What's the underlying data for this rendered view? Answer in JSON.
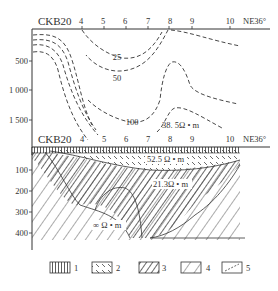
{
  "top_section": {
    "profile_name": "CKB20",
    "direction": "NE36°",
    "station_labels": [
      "4",
      "5",
      "6",
      "7",
      "8",
      "9",
      "10"
    ],
    "depth_ticks": [
      "500",
      "1 000",
      "1 500"
    ],
    "contour_labels": [
      "25",
      "50",
      "100"
    ],
    "resistivity_label": "38. 5Ω • m"
  },
  "bottom_section": {
    "profile_name": "CKB20",
    "direction": "NE36°",
    "station_labels": [
      "4",
      "5",
      "6",
      "7",
      "8",
      "9",
      "10"
    ],
    "depth_ticks": [
      "100",
      "200",
      "300",
      "400"
    ],
    "layer_labels": {
      "surface": "52.5 Ω • m",
      "middle": "21.3Ω • m",
      "basement": "∞ Ω • m"
    }
  },
  "legend": {
    "items": [
      {
        "label": "1",
        "pattern": "vertical-lines"
      },
      {
        "label": "2",
        "pattern": "dashed-backslash"
      },
      {
        "label": "3",
        "pattern": "dense-diagonal"
      },
      {
        "label": "4",
        "pattern": "sparse-diagonal"
      },
      {
        "label": "5",
        "pattern": "dashed-diagonal"
      }
    ]
  },
  "colors": {
    "line": "#333333",
    "hatch": "#444444"
  }
}
